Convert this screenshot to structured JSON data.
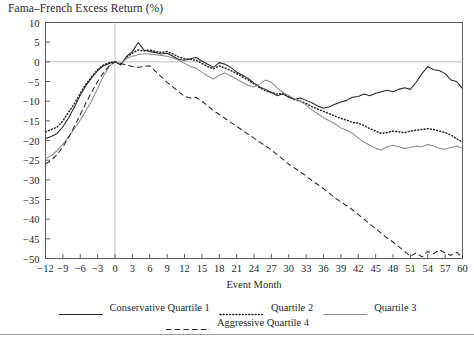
{
  "chart_title": "Fama–French Excess Return (%)",
  "axes": {
    "xlabel": "Event Month",
    "ylabel": "",
    "xticks": [
      -12,
      -9,
      -6,
      -3,
      0,
      3,
      6,
      9,
      12,
      15,
      18,
      21,
      24,
      27,
      30,
      33,
      36,
      39,
      42,
      45,
      48,
      51,
      54,
      57,
      60
    ],
    "yticks": [
      10,
      5,
      0,
      -5,
      -10,
      -15,
      -20,
      -25,
      -30,
      -35,
      -40,
      -45,
      -50
    ],
    "xlim": [
      -12,
      60
    ],
    "ylim": [
      -50,
      10
    ],
    "grid": "zero-line-only",
    "event_line_x": 0
  },
  "legend": {
    "position": "below-plot",
    "rows": [
      [
        {
          "label": "Conservative Quartile 1",
          "style": "solid",
          "color": "#262626"
        },
        {
          "label": "Quartile 2",
          "style": "dotted",
          "color": "#262626"
        },
        {
          "label": "Quartile 3",
          "style": "solid",
          "color": "#8c8c8c"
        }
      ],
      [
        {
          "label": "Aggressive Quartile 4",
          "style": "dashed",
          "color": "#262626"
        }
      ]
    ]
  },
  "chart_data": {
    "type": "line",
    "title": "Fama–French Excess Return (%)",
    "xlabel": "Event Month",
    "ylabel": "Fama–French Excess Return (%)",
    "xlim": [
      -12,
      60
    ],
    "ylim": [
      -50,
      10
    ],
    "grid": false,
    "legend_position": "bottom",
    "x": [
      -12,
      -11,
      -10,
      -9,
      -8,
      -7,
      -6,
      -5,
      -4,
      -3,
      -2,
      -1,
      0,
      1,
      2,
      3,
      4,
      5,
      6,
      7,
      8,
      9,
      10,
      11,
      12,
      13,
      14,
      15,
      16,
      17,
      18,
      19,
      20,
      21,
      22,
      23,
      24,
      25,
      26,
      27,
      28,
      29,
      30,
      31,
      32,
      33,
      34,
      35,
      36,
      37,
      38,
      39,
      40,
      41,
      42,
      43,
      44,
      45,
      46,
      47,
      48,
      49,
      50,
      51,
      52,
      53,
      54,
      55,
      56,
      57,
      58,
      59,
      60
    ],
    "series": [
      {
        "name": "Conservative Quartile 1",
        "style": "solid",
        "color": "#262626",
        "values": [
          -19.5,
          -19.0,
          -18.2,
          -16.5,
          -14.2,
          -11.5,
          -8.5,
          -6.0,
          -4.0,
          -2.2,
          -1.0,
          -0.4,
          0.0,
          -0.8,
          1.4,
          2.6,
          4.9,
          3.0,
          2.6,
          2.4,
          2.0,
          2.2,
          1.4,
          0.6,
          0.4,
          0.8,
          1.1,
          0.2,
          -0.6,
          -1.4,
          -0.2,
          -0.6,
          -1.4,
          -2.6,
          -3.4,
          -4.2,
          -5.4,
          -6.4,
          -7.0,
          -7.8,
          -8.6,
          -8.2,
          -9.0,
          -9.6,
          -9.2,
          -9.8,
          -10.4,
          -11.2,
          -11.8,
          -11.4,
          -10.8,
          -10.2,
          -9.8,
          -9.0,
          -8.8,
          -8.2,
          -8.6,
          -8.0,
          -7.6,
          -7.2,
          -7.6,
          -7.0,
          -6.6,
          -7.0,
          -5.2,
          -3.0,
          -1.2,
          -2.0,
          -2.2,
          -3.0,
          -4.6,
          -5.0,
          -6.8
        ]
      },
      {
        "name": "Quartile 2",
        "style": "dotted",
        "color": "#262626",
        "values": [
          -17.8,
          -17.2,
          -16.6,
          -15.0,
          -12.8,
          -10.6,
          -8.0,
          -5.6,
          -3.8,
          -2.0,
          -0.8,
          -0.2,
          0.0,
          -0.6,
          1.2,
          2.2,
          3.0,
          2.8,
          3.0,
          2.6,
          2.4,
          2.6,
          2.0,
          1.2,
          0.8,
          0.6,
          0.4,
          -0.4,
          -1.2,
          -1.8,
          -1.0,
          -1.6,
          -2.2,
          -3.0,
          -3.8,
          -4.6,
          -5.6,
          -6.6,
          -7.4,
          -7.8,
          -8.2,
          -8.0,
          -8.8,
          -9.6,
          -10.0,
          -10.6,
          -11.4,
          -12.0,
          -12.6,
          -13.2,
          -13.8,
          -14.4,
          -14.8,
          -15.4,
          -15.6,
          -16.2,
          -17.0,
          -17.6,
          -18.2,
          -18.0,
          -17.6,
          -17.8,
          -18.0,
          -17.6,
          -17.4,
          -17.2,
          -17.0,
          -17.2,
          -17.6,
          -18.0,
          -18.6,
          -19.6,
          -20.4
        ]
      },
      {
        "name": "Quartile 3",
        "style": "solid",
        "color": "#8c8c8c",
        "values": [
          -24.6,
          -23.8,
          -22.6,
          -21.0,
          -19.0,
          -17.0,
          -14.8,
          -12.4,
          -9.8,
          -6.8,
          -3.6,
          -1.2,
          0.0,
          -0.4,
          0.8,
          1.4,
          1.8,
          2.0,
          2.0,
          1.8,
          1.6,
          1.4,
          1.0,
          0.4,
          -0.4,
          -1.2,
          -1.6,
          -2.6,
          -3.6,
          -4.4,
          -3.4,
          -2.8,
          -3.6,
          -4.4,
          -5.2,
          -6.0,
          -6.4,
          -5.6,
          -4.6,
          -5.2,
          -6.6,
          -7.8,
          -8.6,
          -9.4,
          -10.0,
          -11.0,
          -12.2,
          -13.2,
          -14.2,
          -15.0,
          -15.8,
          -16.8,
          -17.4,
          -18.2,
          -19.4,
          -20.4,
          -21.2,
          -22.0,
          -22.4,
          -21.6,
          -21.2,
          -21.6,
          -22.0,
          -21.8,
          -21.4,
          -21.6,
          -21.0,
          -21.4,
          -22.0,
          -22.2,
          -21.8,
          -21.4,
          -22.0
        ]
      },
      {
        "name": "Aggressive Quartile 4",
        "style": "dashed",
        "color": "#262626",
        "values": [
          -26.0,
          -25.0,
          -23.6,
          -21.6,
          -19.2,
          -16.4,
          -13.4,
          -10.4,
          -7.6,
          -5.0,
          -2.8,
          -1.0,
          0.0,
          -0.4,
          -0.8,
          -1.2,
          -1.4,
          -1.2,
          -1.0,
          -2.4,
          -3.8,
          -5.2,
          -6.4,
          -7.6,
          -8.8,
          -9.2,
          -9.0,
          -10.0,
          -11.2,
          -12.4,
          -13.4,
          -14.4,
          -15.4,
          -16.4,
          -17.4,
          -18.4,
          -19.4,
          -20.4,
          -21.4,
          -22.4,
          -23.6,
          -24.8,
          -26.0,
          -27.0,
          -28.0,
          -29.0,
          -30.2,
          -31.2,
          -32.2,
          -33.4,
          -34.6,
          -35.6,
          -36.6,
          -37.6,
          -38.8,
          -40.0,
          -41.2,
          -42.4,
          -43.6,
          -44.8,
          -45.8,
          -47.0,
          -48.2,
          -49.4,
          -48.6,
          -49.6,
          -48.2,
          -48.8,
          -47.8,
          -48.6,
          -49.2,
          -48.4,
          -49.8
        ]
      }
    ]
  }
}
